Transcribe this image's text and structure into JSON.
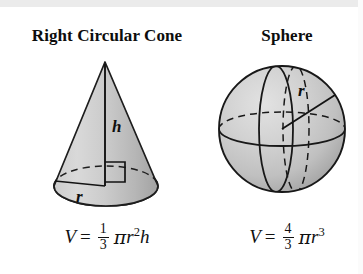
{
  "page": {
    "background_color": "#ffffff",
    "ink_color": "#111111"
  },
  "figures": [
    {
      "id": "right-circular-cone",
      "title": "Right Circular Cone",
      "shape": "cone",
      "labels": [
        {
          "name": "height-label",
          "text": "h"
        },
        {
          "name": "radius-label",
          "text": "r"
        }
      ],
      "markers": [
        "right-angle-square"
      ],
      "formula": {
        "lhs": "V",
        "equals": "=",
        "fraction": {
          "numerator": "1",
          "denominator": "3"
        },
        "pi": "π",
        "radius_var": "r",
        "radius_exp": "2",
        "height_var": "h",
        "plain": "V = 1/3 πr²h"
      },
      "fill": {
        "light": "#d8d8d8",
        "mid": "#c2c2c2",
        "dark": "#a8a8a8"
      }
    },
    {
      "id": "sphere",
      "title": "Sphere",
      "shape": "sphere",
      "labels": [
        {
          "name": "radius-label",
          "text": "r"
        }
      ],
      "markers": [
        "equator-ellipse",
        "meridian-ellipse",
        "dashed-meridian-ellipse",
        "radius-line"
      ],
      "formula": {
        "lhs": "V",
        "equals": "=",
        "fraction": {
          "numerator": "4",
          "denominator": "3"
        },
        "pi": "π",
        "radius_var": "r",
        "radius_exp": "3",
        "plain": "V = 4/3 πr³"
      },
      "fill": {
        "light": "#dcdcdc",
        "mid": "#c4c4c4",
        "dark": "#9e9e9e"
      }
    }
  ]
}
